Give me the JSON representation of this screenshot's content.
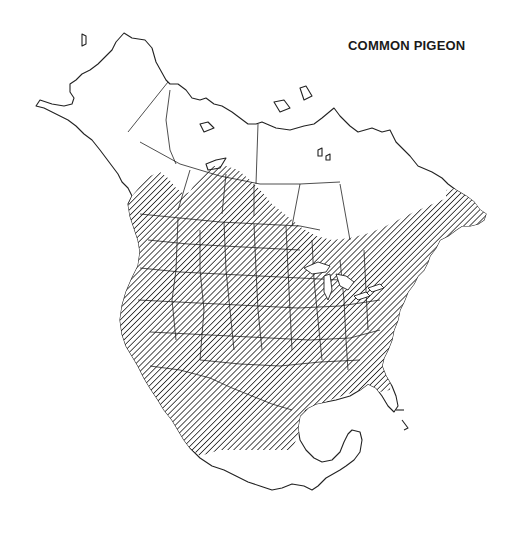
{
  "map": {
    "title": "COMMON PIGEON",
    "region": "North America",
    "legend": {
      "range_style": "diagonal-hatch",
      "range_meaning": "species range"
    },
    "colors": {
      "background": "#ffffff",
      "outline": "#222222",
      "hatch": "#222222"
    }
  }
}
